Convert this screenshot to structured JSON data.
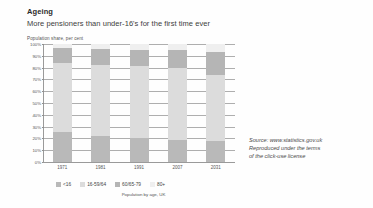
{
  "header": {
    "title": "Ageing",
    "subtitle": "More pensioners than under-16's for the first time ever"
  },
  "source": {
    "line1": "Source: www.statistics.gov.uk",
    "line2": "Reproduced under the terms",
    "line3": "of the click-use license"
  },
  "legend_caption": "Population by age, UK",
  "chart_data": {
    "type": "bar",
    "stacked": true,
    "stack_mode": "percent",
    "title": "Ageing",
    "subtitle": "More pensioners than under-16's for the first time ever",
    "xlabel": "Population by age, UK",
    "ylabel": "Population share, per cent",
    "ylim": [
      0,
      100
    ],
    "grid": true,
    "legend_position": "bottom",
    "categories": [
      "1971",
      "1981",
      "1991",
      "2007",
      "2031"
    ],
    "yticks": [
      "100%",
      "90%",
      "80%",
      "70%",
      "60%",
      "50%",
      "40%",
      "30%",
      "20%",
      "10%",
      "0%"
    ],
    "series": [
      {
        "name": "<16",
        "color": "#b9b9b9",
        "values": [
          25,
          22,
          20,
          19,
          18
        ]
      },
      {
        "name": "16-59/64",
        "color": "#dcdcdc",
        "values": [
          59,
          60,
          61,
          61,
          56
        ]
      },
      {
        "name": "60/65-79",
        "color": "#b5b5b5",
        "values": [
          13,
          14,
          14,
          15,
          19
        ]
      },
      {
        "name": "80+",
        "color": "#efefef",
        "values": [
          3,
          4,
          5,
          5,
          7
        ]
      }
    ]
  }
}
